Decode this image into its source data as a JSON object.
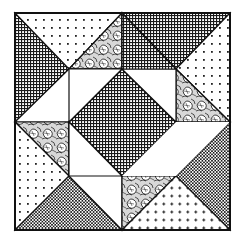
{
  "image": {
    "title": "Quilt block illustration",
    "description": "Pinwheel-style patchwork quilt block in black-and-white line art",
    "colors": {
      "ink": "#111111",
      "paper": "#ffffff"
    }
  },
  "quilt": {
    "fabrics": [
      {
        "name": "fine-check",
        "label": "Fine checkered fabric"
      },
      {
        "name": "polka-dot",
        "label": "Dotted fabric"
      },
      {
        "name": "floral",
        "label": "Floral print fabric"
      },
      {
        "name": "plain-white",
        "label": "Plain white fabric"
      }
    ],
    "center": {
      "shape": "diamond",
      "fabric": "fine-check"
    }
  }
}
